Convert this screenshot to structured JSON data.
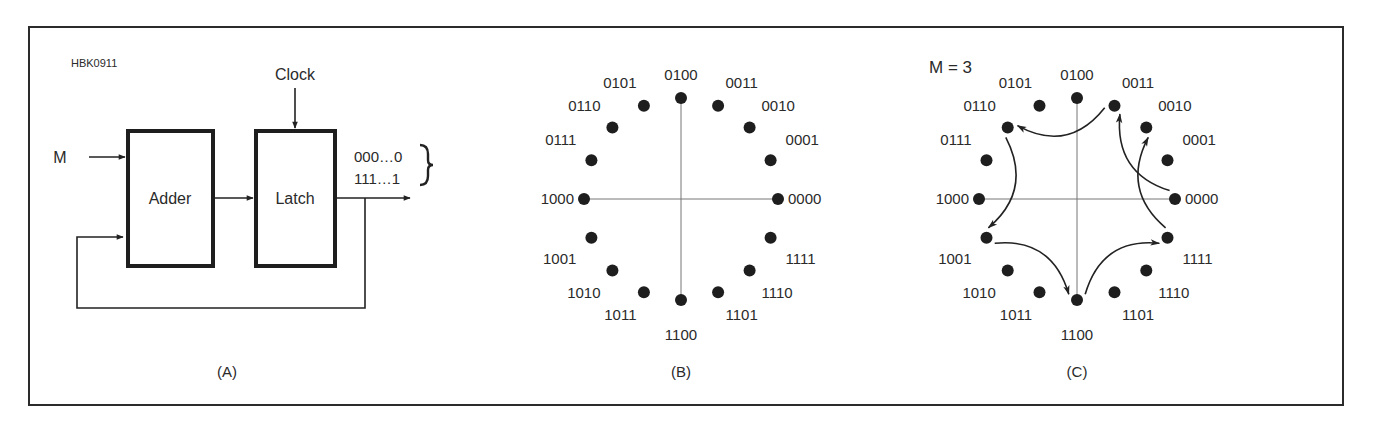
{
  "figure": {
    "id_label": "HBK0911",
    "frame_color": "#2b2b2b",
    "ink_color": "#222222",
    "axis_color": "#777777"
  },
  "panel_a": {
    "caption": "(A)",
    "input_label": "M",
    "clock_label": "Clock",
    "adder_label": "Adder",
    "latch_label": "Latch",
    "output_labels": [
      "000…0",
      "111…1"
    ]
  },
  "panel_b": {
    "caption": "(B)",
    "center": [
      681,
      199
    ],
    "radius": [
      97,
      101
    ],
    "points": [
      "0000",
      "0001",
      "0010",
      "0011",
      "0100",
      "0101",
      "0110",
      "0111",
      "1000",
      "1001",
      "1010",
      "1011",
      "1100",
      "1101",
      "1110",
      "1111"
    ]
  },
  "panel_c": {
    "caption": "(C)",
    "step_label": "M = 3",
    "center": [
      1077,
      199
    ],
    "radius": [
      98,
      101
    ],
    "points": [
      "0000",
      "0001",
      "0010",
      "0011",
      "0100",
      "0101",
      "0110",
      "0111",
      "1000",
      "1001",
      "1010",
      "1011",
      "1100",
      "1101",
      "1110",
      "1111"
    ],
    "transitions": [
      {
        "from": "0000",
        "to": "0011"
      },
      {
        "from": "0011",
        "to": "0110"
      },
      {
        "from": "0110",
        "to": "1001"
      },
      {
        "from": "1001",
        "to": "1100"
      },
      {
        "from": "1100",
        "to": "1111"
      },
      {
        "from": "1111",
        "to": "0010"
      }
    ]
  }
}
